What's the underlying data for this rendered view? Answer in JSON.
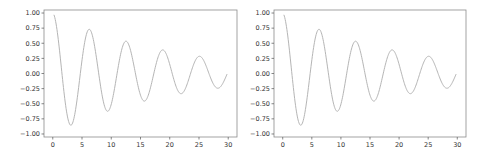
{
  "chart_data": [
    {
      "type": "line",
      "title": "",
      "xlabel": "",
      "ylabel": "",
      "xlim": [
        -1.5,
        31.5
      ],
      "ylim": [
        -1.05,
        1.05
      ],
      "grid": false,
      "legend": null,
      "xticks": [
        "0",
        "5",
        "10",
        "15",
        "20",
        "25",
        "30"
      ],
      "yticks": [
        "1.00",
        "0.75",
        "0.50",
        "0.25",
        "0.00",
        "−0.25",
        "−0.50",
        "−0.75",
        "−1.00"
      ],
      "series": [
        {
          "name": "damped cosine",
          "color": "#b5b5b5",
          "formula": "y = exp(-0.05 t) * cos(t)",
          "x_range": [
            0.2,
            29.8
          ],
          "keypoints": [
            {
              "x": 0.2,
              "y": 0.95
            },
            {
              "x": 3.1,
              "y": -0.95
            },
            {
              "x": 6.2,
              "y": 0.71
            },
            {
              "x": 9.3,
              "y": -0.7
            },
            {
              "x": 12.4,
              "y": 0.52
            },
            {
              "x": 15.6,
              "y": -0.54
            },
            {
              "x": 18.8,
              "y": 0.37
            },
            {
              "x": 21.9,
              "y": -0.4
            },
            {
              "x": 25.1,
              "y": 0.26
            },
            {
              "x": 28.3,
              "y": -0.3
            },
            {
              "x": 29.8,
              "y": -0.05
            }
          ]
        }
      ]
    },
    {
      "type": "line",
      "title": "",
      "xlabel": "",
      "ylabel": "",
      "xlim": [
        -1.5,
        31.5
      ],
      "ylim": [
        -1.05,
        1.05
      ],
      "grid": false,
      "legend": null,
      "xticks": [
        "0",
        "5",
        "10",
        "15",
        "20",
        "25",
        "30"
      ],
      "yticks": [
        "1.00",
        "0.75",
        "0.50",
        "0.25",
        "0.00",
        "−0.25",
        "−0.50",
        "−0.75",
        "−1.00"
      ],
      "series": [
        {
          "name": "damped cosine",
          "color": "#b5b5b5",
          "formula": "y = exp(-0.05 t) * cos(t)",
          "x_range": [
            0.2,
            29.8
          ],
          "keypoints": [
            {
              "x": 0.2,
              "y": 0.95
            },
            {
              "x": 3.1,
              "y": -0.95
            },
            {
              "x": 6.2,
              "y": 0.71
            },
            {
              "x": 9.3,
              "y": -0.7
            },
            {
              "x": 12.4,
              "y": 0.52
            },
            {
              "x": 15.6,
              "y": -0.54
            },
            {
              "x": 18.8,
              "y": 0.37
            },
            {
              "x": 21.9,
              "y": -0.4
            },
            {
              "x": 25.1,
              "y": 0.26
            },
            {
              "x": 28.3,
              "y": -0.3
            },
            {
              "x": 29.8,
              "y": -0.05
            }
          ]
        }
      ]
    }
  ],
  "panels": [
    {
      "id": "left",
      "plot": {
        "left": 44,
        "top": 10,
        "right": 237,
        "bottom": 137
      }
    },
    {
      "id": "right",
      "plot": {
        "left": 274,
        "top": 10,
        "right": 466,
        "bottom": 137
      }
    }
  ]
}
